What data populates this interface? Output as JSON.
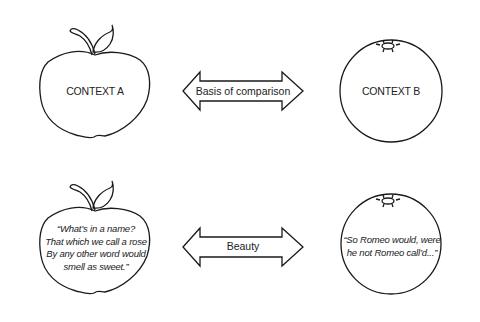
{
  "panels": [
    {
      "name": "context-comparison",
      "left_label": "CONTEXT A",
      "arrow_label": "Basis of comparison",
      "right_label": "CONTEXT B",
      "left_shape": "apple",
      "right_shape": "orange"
    },
    {
      "name": "quote-comparison",
      "left_quote": [
        "“What’s in a name?",
        "That which we call a rose",
        "By any other word would",
        "smell as sweet.”"
      ],
      "arrow_label": "Beauty",
      "right_quote": [
        "“So Romeo would, were",
        "he not Romeo call’d...”"
      ],
      "left_shape": "apple",
      "right_shape": "orange"
    }
  ],
  "colors": {
    "stroke": "#1a1a1a",
    "border": "#b8b8b8",
    "background": "#ffffff"
  }
}
